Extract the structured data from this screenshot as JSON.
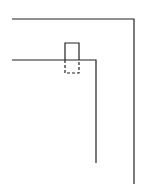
{
  "diagram": {
    "background": "#ffffff",
    "stroke_color": "#222222",
    "outer_path": {
      "points": [
        [
          12,
          19
        ],
        [
          134,
          19
        ],
        [
          134,
          184
        ]
      ]
    },
    "inner_path": {
      "points": [
        [
          12,
          60
        ],
        [
          96,
          60
        ],
        [
          96,
          163
        ]
      ]
    },
    "rectangle": {
      "x": 65,
      "y": 43,
      "width": 14,
      "height": 30,
      "solid_part": {
        "y_from": 43,
        "y_to": 60
      },
      "dashed_part": {
        "y_from": 60,
        "y_to": 73
      }
    }
  }
}
